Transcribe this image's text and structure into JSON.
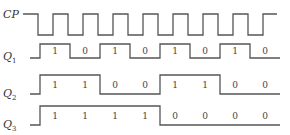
{
  "diagram": {
    "signals": [
      {
        "name": "CP",
        "label": "CP",
        "subscript": "",
        "type": "clock",
        "labelY": 18,
        "highY": 14,
        "lowY": 35,
        "startX": 23,
        "firstEdgeX": 38,
        "halfPeriod": 15,
        "edges": 16,
        "endX": 277,
        "bits": []
      },
      {
        "name": "Q1",
        "label": "Q",
        "subscript": "1",
        "type": "data",
        "labelY": 60,
        "highY": 44,
        "lowY": 58,
        "startX": 30,
        "firstEdgeX": 40,
        "cellWidth": 30,
        "endX": 280,
        "bits": [
          "1",
          "0",
          "1",
          "0",
          "1",
          "0",
          "1",
          "0"
        ]
      },
      {
        "name": "Q2",
        "label": "Q",
        "subscript": "2",
        "type": "data",
        "labelY": 97,
        "highY": 75,
        "lowY": 94,
        "startX": 30,
        "firstEdgeX": 40,
        "cellWidth": 30,
        "endX": 280,
        "bits": [
          "1",
          "1",
          "0",
          "0",
          "1",
          "1",
          "0",
          "0"
        ]
      },
      {
        "name": "Q3",
        "label": "Q",
        "subscript": "3",
        "type": "data",
        "labelY": 128,
        "highY": 106,
        "lowY": 125,
        "startX": 30,
        "firstEdgeX": 40,
        "cellWidth": 30,
        "endX": 280,
        "bits": [
          "1",
          "1",
          "1",
          "1",
          "0",
          "0",
          "0",
          "0"
        ]
      }
    ],
    "colors": {
      "line": "#555555",
      "text": "#333333",
      "background": "#ffffff"
    }
  }
}
